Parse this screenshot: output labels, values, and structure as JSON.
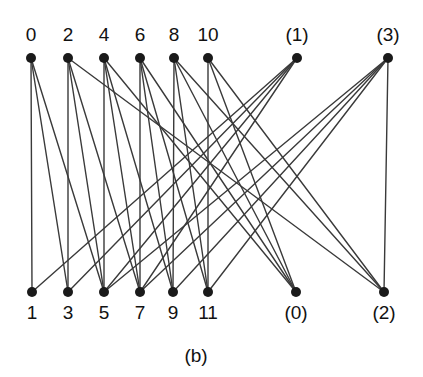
{
  "figure": {
    "caption": "(b)",
    "caption_x": 196,
    "caption_y": 345,
    "width": 423,
    "height": 377,
    "background": "#ffffff",
    "edge_color": "#3a3a3a",
    "node_color": "#1a1a1a",
    "node_radius": 5,
    "edge_width": 1.4
  },
  "graph": {
    "type": "bipartite-graph",
    "top_row_y": 58,
    "bottom_row_y": 292,
    "top_label_y": 24,
    "bottom_label_y": 302,
    "top_nodes": [
      {
        "id": "t0",
        "label": "0",
        "x": 31
      },
      {
        "id": "t2",
        "label": "2",
        "x": 68
      },
      {
        "id": "t4",
        "label": "4",
        "x": 104
      },
      {
        "id": "t6",
        "label": "6",
        "x": 140
      },
      {
        "id": "t8",
        "label": "8",
        "x": 174
      },
      {
        "id": "t10",
        "label": "10",
        "x": 208
      },
      {
        "id": "p1",
        "label": "(1)",
        "x": 297
      },
      {
        "id": "p3",
        "label": "(3)",
        "x": 388
      }
    ],
    "bottom_nodes": [
      {
        "id": "b1",
        "label": "1",
        "x": 32
      },
      {
        "id": "b3",
        "label": "3",
        "x": 68
      },
      {
        "id": "b5",
        "label": "5",
        "x": 104
      },
      {
        "id": "b7",
        "label": "7",
        "x": 140
      },
      {
        "id": "b9",
        "label": "9",
        "x": 173
      },
      {
        "id": "b11",
        "label": "11",
        "x": 208
      },
      {
        "id": "p0",
        "label": "(0)",
        "x": 296
      },
      {
        "id": "p2",
        "label": "(2)",
        "x": 384
      }
    ],
    "edges": [
      {
        "from": "t0",
        "to": "b1"
      },
      {
        "from": "t0",
        "to": "b3"
      },
      {
        "from": "t0",
        "to": "b5"
      },
      {
        "from": "t2",
        "to": "b3"
      },
      {
        "from": "t2",
        "to": "b5"
      },
      {
        "from": "t2",
        "to": "b7"
      },
      {
        "from": "t4",
        "to": "b5"
      },
      {
        "from": "t4",
        "to": "b7"
      },
      {
        "from": "t4",
        "to": "b9"
      },
      {
        "from": "t6",
        "to": "b7"
      },
      {
        "from": "t6",
        "to": "b9"
      },
      {
        "from": "t6",
        "to": "b11"
      },
      {
        "from": "t8",
        "to": "b9"
      },
      {
        "from": "t8",
        "to": "b11"
      },
      {
        "from": "t8",
        "to": "p0"
      },
      {
        "from": "t10",
        "to": "b11"
      },
      {
        "from": "t10",
        "to": "p0"
      },
      {
        "from": "t10",
        "to": "p2"
      },
      {
        "from": "p1",
        "to": "b1"
      },
      {
        "from": "p1",
        "to": "b3"
      },
      {
        "from": "p1",
        "to": "b5"
      },
      {
        "from": "p1",
        "to": "b7"
      },
      {
        "from": "p3",
        "to": "b5"
      },
      {
        "from": "p3",
        "to": "b7"
      },
      {
        "from": "p3",
        "to": "b9"
      },
      {
        "from": "p3",
        "to": "b11"
      },
      {
        "from": "t4",
        "to": "p0"
      },
      {
        "from": "t6",
        "to": "p0"
      },
      {
        "from": "t2",
        "to": "p2"
      },
      {
        "from": "t8",
        "to": "p2"
      },
      {
        "from": "p3",
        "to": "p2"
      }
    ]
  }
}
